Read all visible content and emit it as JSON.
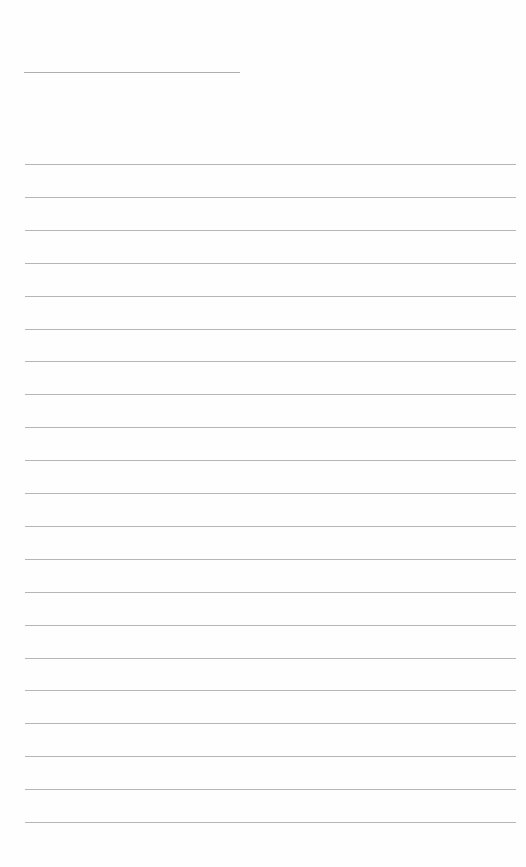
{
  "page": {
    "type": "ruled-lined-paper",
    "background_color": "#fefefe",
    "line_color": "#a9a9a9",
    "header_line": {
      "x_start": 24,
      "x_end": 240,
      "y": 72
    },
    "ruled_lines": {
      "count": 21,
      "first_y": 164,
      "spacing": 32.9,
      "x_start": 25,
      "x_end": 516
    }
  }
}
